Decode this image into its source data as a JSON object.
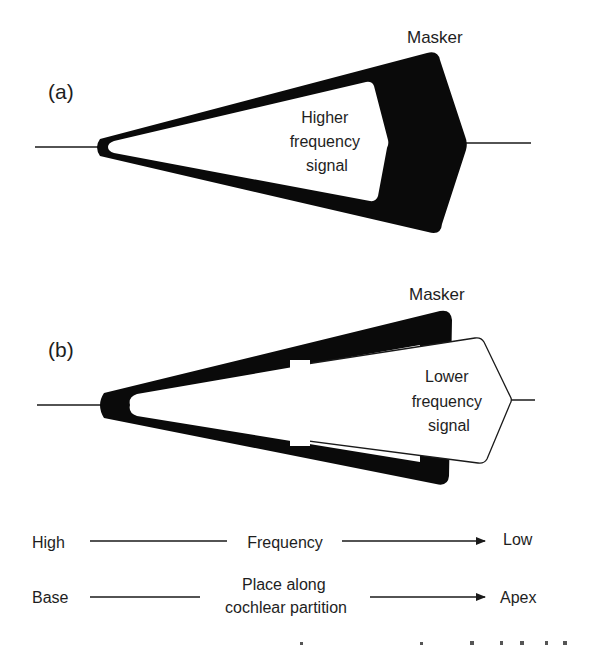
{
  "panel_a": {
    "label": "(a)",
    "masker_label": "Masker",
    "signal_lines": [
      "Higher",
      "frequency",
      "signal"
    ]
  },
  "panel_b": {
    "label": "(b)",
    "masker_label": "Masker",
    "signal_lines": [
      "Lower",
      "frequency",
      "signal"
    ]
  },
  "axes": {
    "frequency": {
      "left": "High",
      "middle": "Frequency",
      "right": "Low"
    },
    "place": {
      "left": "Base",
      "middle_lines": [
        "Place along",
        "cochlear partition"
      ],
      "right": "Apex"
    }
  },
  "colors": {
    "ink": "#0a0a0a",
    "text": "#1e1e1e",
    "background": "#ffffff"
  }
}
